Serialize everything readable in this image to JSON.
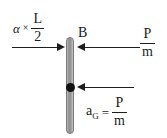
{
  "figure": {
    "background_color": "#ffffff",
    "ink_color": "#1d1d1d",
    "bar_color": "#9a9a9a"
  },
  "bar": {
    "label": "rigid-bar",
    "point_b_label": "B",
    "center_of_mass_label": "G"
  },
  "labels": {
    "alpha_symbol": "α",
    "times_symbol": "×",
    "alpha_numerator": "L",
    "alpha_denominator": "2",
    "point_b": "B",
    "impulse_numerator": "P",
    "impulse_denominator": "m",
    "acceleration_symbol": "a",
    "acceleration_subscript": "G",
    "equals_symbol": "=",
    "acceleration_numerator": "P",
    "acceleration_denominator": "m"
  },
  "arrows": [
    {
      "name": "alpha-times-half-L",
      "direction": "right",
      "expression": "α × L/2",
      "attaches_to": "bar-top"
    },
    {
      "name": "velocity-at-B",
      "direction": "left",
      "expression": "P/m",
      "attaches_to": "point-B"
    },
    {
      "name": "acceleration-at-G",
      "direction": "left",
      "expression": "a_G = P/m",
      "attaches_to": "center-of-mass"
    }
  ]
}
